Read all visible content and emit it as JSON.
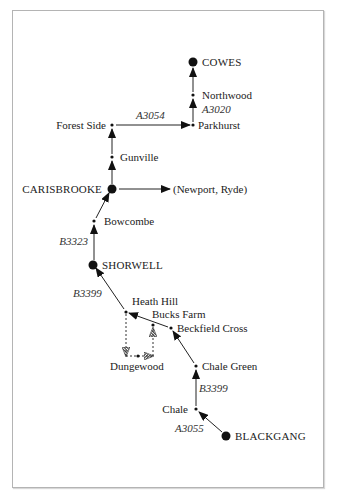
{
  "diagram": {
    "type": "route-map",
    "towns": [
      {
        "id": "cowes",
        "label": "COWES",
        "kind": "major"
      },
      {
        "id": "northwood",
        "label": "Northwood",
        "kind": "minor"
      },
      {
        "id": "parkhurst",
        "label": "Parkhurst",
        "kind": "minor"
      },
      {
        "id": "forest_side",
        "label": "Forest Side",
        "kind": "minor"
      },
      {
        "id": "gunville",
        "label": "Gunville",
        "kind": "minor"
      },
      {
        "id": "carisbrooke",
        "label": "CARISBROOKE",
        "kind": "major"
      },
      {
        "id": "newport_ryde",
        "label": "(Newport, Ryde)",
        "kind": "destination"
      },
      {
        "id": "bowcombe",
        "label": "Bowcombe",
        "kind": "minor"
      },
      {
        "id": "shorwell",
        "label": "SHORWELL",
        "kind": "major"
      },
      {
        "id": "heath_hill",
        "label": "Heath Hill",
        "kind": "minor"
      },
      {
        "id": "bucks_farm",
        "label": "Bucks Farm",
        "kind": "minor"
      },
      {
        "id": "beckfield_cross",
        "label": "Beckfield Cross",
        "kind": "minor"
      },
      {
        "id": "dungewood",
        "label": "Dungewood",
        "kind": "minor"
      },
      {
        "id": "chale_green",
        "label": "Chale Green",
        "kind": "minor"
      },
      {
        "id": "chale",
        "label": "Chale",
        "kind": "minor"
      },
      {
        "id": "blackgang",
        "label": "BLACKGANG",
        "kind": "major"
      }
    ],
    "roads": [
      {
        "label": "A3020"
      },
      {
        "label": "A3054"
      },
      {
        "label": "B3323"
      },
      {
        "label": "B3399"
      },
      {
        "label": "B3399"
      },
      {
        "label": "A3055"
      }
    ],
    "edges": [
      {
        "from": "blackgang",
        "to": "chale",
        "road": "A3055",
        "style": "solid"
      },
      {
        "from": "chale",
        "to": "chale_green",
        "road": "B3399",
        "style": "solid"
      },
      {
        "from": "chale_green",
        "to": "beckfield_cross",
        "style": "solid"
      },
      {
        "from": "beckfield_cross",
        "to": "heath_hill",
        "style": "solid"
      },
      {
        "from": "heath_hill",
        "to": "dungewood",
        "style": "dashed"
      },
      {
        "from": "dungewood",
        "to": "bucks_farm",
        "style": "dashed"
      },
      {
        "from": "heath_hill",
        "to": "shorwell",
        "road": "B3399",
        "style": "solid"
      },
      {
        "from": "shorwell",
        "to": "bowcombe",
        "road": "B3323",
        "style": "solid"
      },
      {
        "from": "bowcombe",
        "to": "carisbrooke",
        "style": "solid"
      },
      {
        "from": "carisbrooke",
        "to": "newport_ryde",
        "style": "solid"
      },
      {
        "from": "carisbrooke",
        "to": "gunville",
        "style": "solid"
      },
      {
        "from": "gunville",
        "to": "forest_side",
        "style": "solid"
      },
      {
        "from": "forest_side",
        "to": "parkhurst",
        "road": "A3054",
        "style": "solid"
      },
      {
        "from": "parkhurst",
        "to": "northwood",
        "road": "A3020",
        "style": "solid"
      },
      {
        "from": "northwood",
        "to": "cowes",
        "style": "solid"
      }
    ]
  }
}
